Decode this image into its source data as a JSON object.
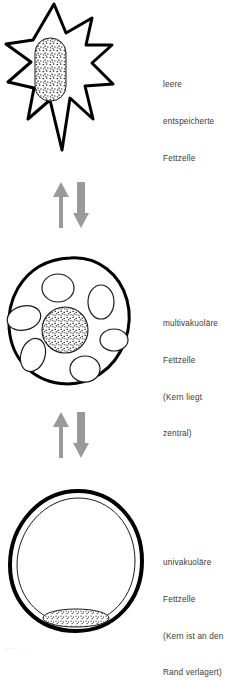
{
  "diagram": {
    "background": "#ffffff",
    "ink": "#000000",
    "arrow_color": "#9a9a9a",
    "text_color": "#3a3a3a",
    "footer_fragment": "·····   ··"
  },
  "panels": [
    {
      "id": "empty-fat-cell",
      "shape": "star",
      "nucleus": "oval-central-stippled",
      "vacuole_count": 0,
      "label_lines": [
        "leere",
        "entspeicherte",
        "Fettzelle"
      ]
    },
    {
      "id": "multivacuolar-fat-cell",
      "shape": "round-lobed",
      "nucleus": "circle-central-stippled",
      "vacuole_count": 6,
      "label_lines": [
        "multivakuoläre",
        "Fettzelle",
        "(Kern liegt",
        "zentral)"
      ]
    },
    {
      "id": "univacuolar-fat-cell",
      "shape": "round-large",
      "nucleus": "flattened-peripheral-stippled",
      "vacuole_count": 1,
      "label_lines": [
        "univakuoläre",
        "Fettzelle",
        "(Kern ist an den",
        "Rand verlagert)"
      ]
    }
  ],
  "arrow_groups": [
    {
      "id": "arrows-top",
      "up_label": "Lipogenese",
      "down_label": "Lipolyse"
    },
    {
      "id": "arrows-bottom",
      "up_label": "Lipogenese",
      "down_label": "Lipolyse"
    }
  ]
}
